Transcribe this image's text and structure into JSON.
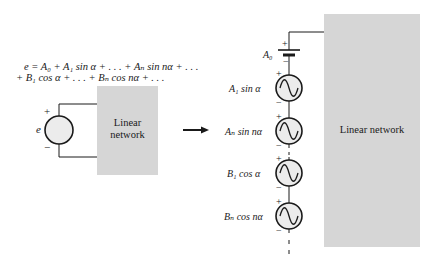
{
  "equation": {
    "line1": "e = A₀ + A₁ sin α + . . . + Aₙ sin nα + . . .",
    "line2": "+ B₁ cos α + . . . + Bₙ cos nα + . . ."
  },
  "left_circuit": {
    "source_label": "e",
    "plus": "+",
    "minus": "−",
    "network_label_line1": "Linear",
    "network_label_line2": "network"
  },
  "arrow": {
    "direction": "right"
  },
  "right_circuit": {
    "network_label": "Linear network",
    "dc_source": {
      "label": "A₀",
      "plus": "+",
      "minus": "−"
    },
    "sources": [
      {
        "label": "A₁ sin α",
        "plus": "+",
        "minus": "−"
      },
      {
        "label": "Aₙ sin nα",
        "plus": "+",
        "minus": "−"
      },
      {
        "label": "B₁ cos α",
        "plus": "+",
        "minus": "−"
      },
      {
        "label": "Bₙ cos nα",
        "plus": "+",
        "minus": "−"
      }
    ]
  },
  "colors": {
    "network_fill": "#d6d6d6",
    "source_fill": "#ececec",
    "line": "#1a1a1a"
  }
}
